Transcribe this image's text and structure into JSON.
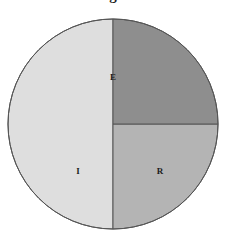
{
  "figure": {
    "title_fragment": "g",
    "background_color": "#ffffff",
    "width": 226,
    "height": 243
  },
  "chart_data": {
    "type": "pie",
    "title": "",
    "xlabel": "",
    "ylabel": "",
    "legend_position": "none",
    "grid": false,
    "labels_inside_slices": true,
    "center": {
      "x": 113,
      "y": 124
    },
    "radius": 105,
    "start_angle_deg": 180,
    "direction": "clockwise",
    "outline_color": "#555555",
    "outline_width": 1,
    "categories": [
      "E",
      "I",
      "R"
    ],
    "values": [
      50,
      25,
      25
    ],
    "slices": [
      {
        "label": "E",
        "value": 50,
        "percent": "50%",
        "color": "#dedede",
        "start_angle_deg": 180,
        "end_angle_deg": 360,
        "label_x": 113,
        "label_y": 78
      },
      {
        "label": "I",
        "value": 25,
        "percent": "25%",
        "color": "#b4b4b4",
        "start_angle_deg": 90,
        "end_angle_deg": 180,
        "label_x": 78,
        "label_y": 172
      },
      {
        "label": "R",
        "value": 25,
        "percent": "25%",
        "color": "#8e8e8e",
        "start_angle_deg": 0,
        "end_angle_deg": 90,
        "label_x": 160,
        "label_y": 172
      }
    ]
  }
}
